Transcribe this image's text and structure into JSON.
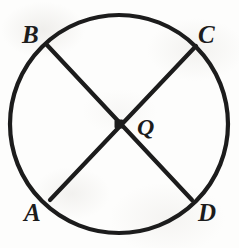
{
  "figure": {
    "name": "circle-with-two-diameters",
    "background_color": "#fdfdfc",
    "stroke_color": "#1c1c1c",
    "circle": {
      "center_x": 119,
      "center_y": 124,
      "radius": 109,
      "stroke_width": 4.2
    },
    "center_point": {
      "label": "Q",
      "x": 119,
      "y": 124,
      "marker": "filled-dot",
      "marker_size": 9
    },
    "chords": [
      {
        "name": "diameter-AC",
        "from": "A",
        "to": "C",
        "x1": 50,
        "y1": 200,
        "x2": 196,
        "y2": 46,
        "stroke_width": 4.2
      },
      {
        "name": "diameter-BD",
        "from": "B",
        "to": "D",
        "x1": 47,
        "y1": 45,
        "x2": 192,
        "y2": 200,
        "stroke_width": 4.2
      }
    ],
    "labels": [
      {
        "id": "B",
        "text": "B",
        "position": "upper-left",
        "x": 22,
        "y": 22
      },
      {
        "id": "C",
        "text": "C",
        "position": "upper-right",
        "x": 198,
        "y": 22
      },
      {
        "id": "A",
        "text": "A",
        "position": "lower-left",
        "x": 24,
        "y": 200
      },
      {
        "id": "D",
        "text": "D",
        "position": "lower-right",
        "x": 198,
        "y": 200
      },
      {
        "id": "Q",
        "text": "Q",
        "position": "center-right",
        "x": 137,
        "y": 115
      }
    ]
  }
}
